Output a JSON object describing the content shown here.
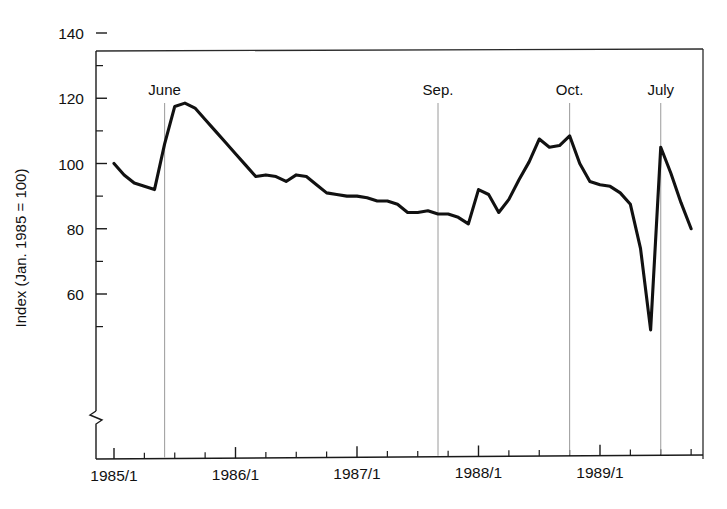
{
  "chart_data": {
    "type": "line",
    "title": "",
    "xlabel": "",
    "ylabel": "Index (Jan. 1985 = 100)",
    "ylim": [
      45,
      140
    ],
    "yticks": [
      60,
      80,
      100,
      120,
      140
    ],
    "yticklabels": [
      "60",
      "80",
      "100",
      "120",
      "140"
    ],
    "yminorticks": [
      50,
      70,
      90,
      110,
      130
    ],
    "axis_break": true,
    "axis_break_note": "y-axis broken below 50",
    "grid": false,
    "legend": null,
    "xticklabels": [
      "1985/1",
      "1986/1",
      "1987/1",
      "1988/1",
      "1989/1"
    ],
    "xtick_years": [
      1985,
      1986,
      1987,
      1988,
      1989
    ],
    "x_minor_interval_months": 3,
    "series": [
      {
        "name": "Index",
        "x": [
          "1985/1",
          "1985/2",
          "1985/3",
          "1985/4",
          "1985/5",
          "1985/6",
          "1985/7",
          "1985/8",
          "1985/9",
          "1985/10",
          "1985/11",
          "1985/12",
          "1986/1",
          "1986/2",
          "1986/3",
          "1986/4",
          "1986/5",
          "1986/6",
          "1986/7",
          "1986/8",
          "1986/9",
          "1986/10",
          "1986/11",
          "1986/12",
          "1987/1",
          "1987/2",
          "1987/3",
          "1987/4",
          "1987/5",
          "1987/6",
          "1987/7",
          "1987/8",
          "1987/9",
          "1987/10",
          "1987/11",
          "1987/12",
          "1988/1",
          "1988/2",
          "1988/3",
          "1988/4",
          "1988/5",
          "1988/6",
          "1988/7",
          "1988/8",
          "1988/9",
          "1988/10",
          "1988/11",
          "1988/12",
          "1989/1",
          "1989/2",
          "1989/3",
          "1989/4",
          "1989/5",
          "1989/6",
          "1989/7",
          "1989/8",
          "1989/9",
          "1989/10"
        ],
        "values": [
          100.0,
          96.5,
          94.0,
          93.0,
          92.0,
          106.0,
          117.5,
          118.5,
          117.0,
          113.5,
          110.0,
          106.5,
          103.0,
          99.5,
          96.0,
          96.5,
          96.0,
          94.5,
          96.5,
          96.0,
          93.5,
          91.0,
          90.5,
          90.0,
          90.0,
          89.5,
          88.5,
          88.5,
          87.5,
          85.0,
          85.0,
          85.5,
          84.5,
          84.5,
          83.5,
          81.5,
          92.0,
          90.5,
          85.0,
          89.0,
          95.0,
          100.5,
          107.5,
          105.0,
          105.5,
          108.5,
          100.0,
          94.5,
          93.5,
          93.0,
          91.0,
          87.5,
          74.0,
          49.0,
          105.0,
          97.0,
          88.0,
          80.0
        ]
      }
    ],
    "annotations": [
      {
        "label": "June",
        "x": "1985/6"
      },
      {
        "label": "Sep.",
        "x": "1987/9"
      },
      {
        "label": "Oct.",
        "x": "1988/10"
      },
      {
        "label": "July",
        "x": "1989/7"
      }
    ]
  },
  "colors": {
    "line": "#111111",
    "axis": "#1a1a1a",
    "annotation_line": "#9a9a9a",
    "background": "#ffffff"
  }
}
